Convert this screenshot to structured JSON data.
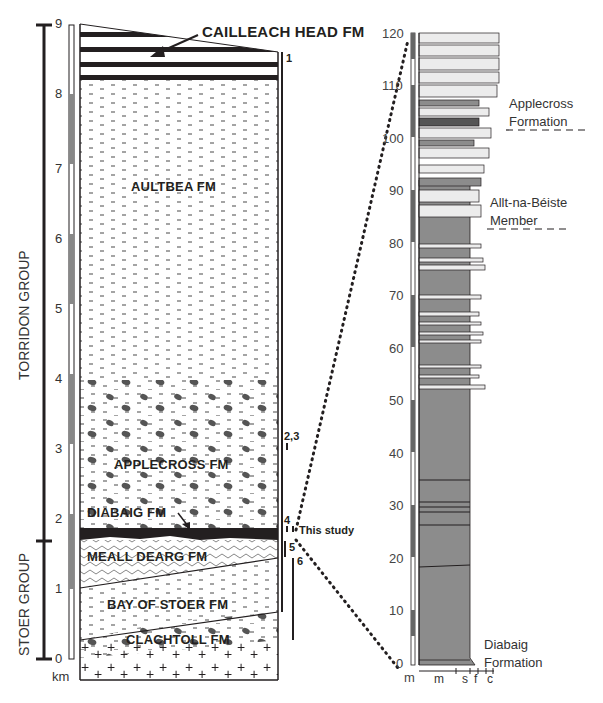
{
  "left_column": {
    "unit_label": "km",
    "ticks": [
      "0",
      "1",
      "2",
      "3",
      "4",
      "5",
      "6",
      "7",
      "8",
      "9"
    ],
    "groups": [
      {
        "name": "TORRIDON GROUP"
      },
      {
        "name": "STOER GROUP"
      }
    ],
    "formations": [
      {
        "name": "CAILLEACH HEAD FM"
      },
      {
        "name": "AULTBEA FM"
      },
      {
        "name": "APPLECROSS FM"
      },
      {
        "name": "DIABAIG FM"
      },
      {
        "name": "MEALL DEARG FM"
      },
      {
        "name": "BAY OF STOER FM"
      },
      {
        "name": "CLACHTOLL FM"
      }
    ],
    "references": [
      "1",
      "2,3",
      "4",
      "5",
      "6"
    ],
    "this_study": "This study"
  },
  "right_column": {
    "unit_label": "m",
    "ticks": [
      "0",
      "10",
      "20",
      "30",
      "40",
      "50",
      "60",
      "70",
      "80",
      "90",
      "100",
      "110",
      "120"
    ],
    "grain_axis": [
      "m",
      "s",
      "f",
      "c"
    ],
    "annotations": [
      {
        "line1": "Applecross",
        "line2": "Formation"
      },
      {
        "line1": "Allt-na-Béiste",
        "line2": "Member"
      },
      {
        "line1": "Diabaig",
        "line2": "Formation"
      }
    ]
  },
  "colors": {
    "mudstone": "#8c8c8c",
    "sandstone": "#ececec",
    "ink": "#231f20",
    "conglomerate": "#555555"
  }
}
